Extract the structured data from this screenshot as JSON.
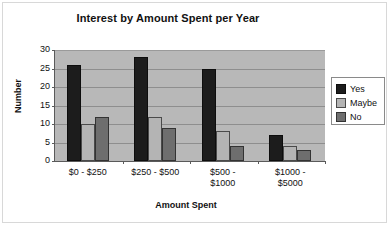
{
  "chart_data": {
    "type": "bar",
    "title": "Interest by Amount Spent per Year",
    "xlabel": "Amount Spent",
    "ylabel": "Number",
    "categories": [
      "$0 - $250",
      "$250 - $500",
      "$500 - $1000",
      "$1000 - $5000"
    ],
    "category_lines": [
      [
        "$0 - $250"
      ],
      [
        "$250 - $500"
      ],
      [
        "$500 -",
        "$1000"
      ],
      [
        "$1000 -",
        "$5000"
      ]
    ],
    "series": [
      {
        "name": "Yes",
        "color": "#1c1c1c",
        "values": [
          26,
          28,
          25,
          7
        ]
      },
      {
        "name": "Maybe",
        "color": "#b4b4b4",
        "values": [
          10,
          12,
          8,
          4
        ]
      },
      {
        "name": "No",
        "color": "#6e6e6e",
        "values": [
          12,
          9,
          4,
          3
        ]
      }
    ],
    "ylim": [
      0,
      30
    ],
    "ytick_values": [
      0,
      5,
      10,
      15,
      20,
      25,
      30
    ],
    "ytick_labels": [
      "0",
      "5",
      "10",
      "15",
      "20",
      "25",
      "30"
    ],
    "grid": true,
    "legend_position": "right",
    "plot_background": "#b8b8b8",
    "page_background": "#ffffff"
  }
}
